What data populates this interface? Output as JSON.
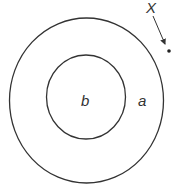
{
  "diagram": {
    "labels": {
      "inner_region": "b",
      "outer_region": "a",
      "point": "X"
    },
    "shapes": {
      "outer_circle": {
        "cx": 86.5,
        "cy": 100.5,
        "rx": 77,
        "ry": 82.5
      },
      "inner_circle": {
        "cx": 86,
        "cy": 97,
        "rx": 39.5,
        "ry": 42
      },
      "point": {
        "cx": 169,
        "cy": 51,
        "r": 1.8
      }
    },
    "colors": {
      "stroke": "#333333",
      "background": "#ffffff"
    }
  }
}
